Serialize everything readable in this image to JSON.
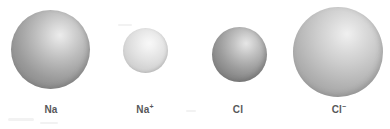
{
  "figure": {
    "name": "atomic-and-ionic-radii-comparison",
    "background_color": "#ffffff",
    "width": 390,
    "height": 129,
    "label_color": "#58585a"
  },
  "atoms": [
    {
      "id": "sodium-atom",
      "label": "Na",
      "charge": "",
      "center_x": 51,
      "center_y": 49,
      "diameter": 79,
      "highlight_color": "#ececec",
      "mid_color": "#b8b8b8",
      "edge_color": "#868686",
      "rim_color": "#7d7d7d"
    },
    {
      "id": "sodium-ion",
      "label": "Na",
      "charge": "+",
      "center_x": 145,
      "center_y": 50,
      "diameter": 45,
      "highlight_color": "#f6f6f6",
      "mid_color": "#dcdcdc",
      "edge_color": "#c2c2c2",
      "rim_color": "#9b9b9b"
    },
    {
      "id": "chlorine-atom",
      "label": "Cl",
      "charge": "",
      "center_x": 239,
      "center_y": 54,
      "diameter": 55,
      "highlight_color": "#e4e4e4",
      "mid_color": "#ababab",
      "edge_color": "#7a7a7a",
      "rim_color": "#6f6f6f"
    },
    {
      "id": "chloride-ion",
      "label": "Cl",
      "charge": "−",
      "center_x": 338,
      "center_y": 52,
      "diameter": 90,
      "highlight_color": "#eeeeee",
      "mid_color": "#c4c4c4",
      "edge_color": "#989898",
      "rim_color": "#8d8d8d"
    }
  ]
}
